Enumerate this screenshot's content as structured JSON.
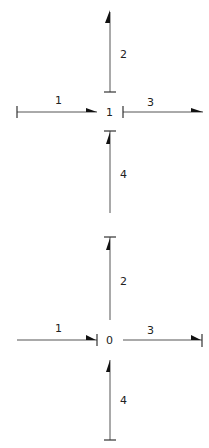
{
  "diagrams": [
    {
      "node_label": "1",
      "arms": [
        {
          "label": "1",
          "direction": "incoming-from-left"
        },
        {
          "label": "2",
          "direction": "outgoing-up"
        },
        {
          "label": "3",
          "direction": "outgoing-right"
        },
        {
          "label": "4",
          "direction": "incoming-from-below"
        }
      ]
    },
    {
      "node_label": "0",
      "arms": [
        {
          "label": "1",
          "direction": "incoming-from-left"
        },
        {
          "label": "2",
          "direction": "outgoing-up"
        },
        {
          "label": "3",
          "direction": "outgoing-right"
        },
        {
          "label": "4",
          "direction": "incoming-from-below"
        }
      ]
    }
  ],
  "colors": {
    "line": "#555555",
    "arrowhead": "#111111",
    "text": "#222222"
  }
}
